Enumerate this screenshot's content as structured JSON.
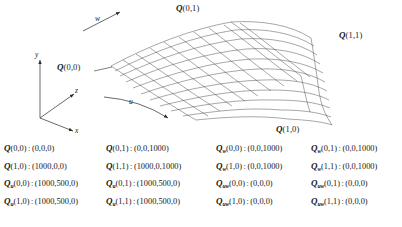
{
  "figure": {
    "axes": [
      {
        "name": "y-axis",
        "label": "y"
      },
      {
        "name": "z-axis",
        "label": "z"
      },
      {
        "name": "x-axis",
        "label": "x"
      }
    ],
    "parameter_arrows": [
      {
        "name": "w-direction-arrow",
        "label": "w"
      },
      {
        "name": "u-direction-arrow",
        "label": "u"
      }
    ],
    "corner_labels": [
      {
        "name": "corner-q00",
        "symbol": "Q",
        "args": "(0,0)"
      },
      {
        "name": "corner-q01",
        "symbol": "Q",
        "args": "(0,1)"
      },
      {
        "name": "corner-q11",
        "symbol": "Q",
        "args": "(1,1)"
      },
      {
        "name": "corner-q10",
        "symbol": "Q",
        "args": "(1,0)"
      }
    ],
    "surface": {
      "name": "bicubic-patch-mesh",
      "grid_u": 10,
      "grid_w": 10,
      "stroke": "#3a3a3a"
    }
  },
  "data_columns": [
    {
      "name": "column-1",
      "rows": [
        {
          "symbol": "Q",
          "sub": "",
          "args": "(0,0)",
          "value": "(0,0,0)"
        },
        {
          "symbol": "Q",
          "sub": "",
          "args": "(1,0)",
          "value": "(1000,0,0)"
        },
        {
          "symbol": "Q",
          "sub": "u",
          "args": "(0,0)",
          "value": "(1000,500,0)"
        },
        {
          "symbol": "Q",
          "sub": "u",
          "args": "(1,0)",
          "value": "(1000,500,0)"
        }
      ]
    },
    {
      "name": "column-2",
      "rows": [
        {
          "symbol": "Q",
          "sub": "",
          "args": "(0,1)",
          "value": "(0,0,1000)"
        },
        {
          "symbol": "Q",
          "sub": "",
          "args": "(1,1)",
          "value": "(1000,0,1000)"
        },
        {
          "symbol": "Q",
          "sub": "u",
          "args": "(0,1)",
          "value": "(1000,500,0)"
        },
        {
          "symbol": "Q",
          "sub": "u",
          "args": "(1,1)",
          "value": "(1000,500,0)"
        }
      ]
    },
    {
      "name": "column-3",
      "rows": [
        {
          "symbol": "Q",
          "sub": "w",
          "args": "(0,0)",
          "value": "(0,0,1000)"
        },
        {
          "symbol": "Q",
          "sub": "w",
          "args": "(1,0)",
          "value": "(0,0,1000)"
        },
        {
          "symbol": "Q",
          "sub": "uw",
          "args": "(0,0)",
          "value": "(0,0,0)"
        },
        {
          "symbol": "Q",
          "sub": "uw",
          "args": "(1,0)",
          "value": "(0,0,0)"
        }
      ]
    },
    {
      "name": "column-4",
      "rows": [
        {
          "symbol": "Q",
          "sub": "w",
          "args": "(0,1)",
          "value": "(0,0,1000)"
        },
        {
          "symbol": "Q",
          "sub": "w",
          "args": "(1,1)",
          "value": "(0,0,1000)"
        },
        {
          "symbol": "Q",
          "sub": "uw",
          "args": "(0,1)",
          "value": "(0,0,0)"
        },
        {
          "symbol": "Q",
          "sub": "uw",
          "args": "(1,1)",
          "value": "(0,0,0)"
        }
      ]
    }
  ],
  "separator": ":"
}
